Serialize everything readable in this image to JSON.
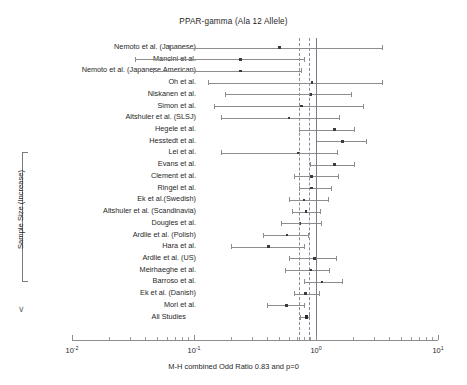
{
  "chart_data": {
    "type": "forest",
    "title": "PPAR-gamma (Ala 12 Allele)",
    "xlabel": "M-H combined Odd Ratio 0.83 and p=0",
    "ylabel": "Sample Size (Increase)",
    "xscale": "log10",
    "xlim": [
      0.01,
      10
    ],
    "grid": false,
    "legend": "none",
    "x_tick_labels": [
      "10",
      "10",
      "10",
      "10"
    ],
    "x_tick_exponents": [
      "-2",
      "-1",
      "0",
      "1"
    ],
    "x_tick_values": [
      0.01,
      0.1,
      1,
      10
    ],
    "reference_line_value": 1.0,
    "pooled_ci_lines": [
      0.73,
      0.87
    ],
    "pooled_odd_ratio": 0.83,
    "pooled_p_value": 0,
    "categories": [
      "Nemoto et al. (Japanese)",
      "Mancini et al.",
      "Nemoto et al. (Japanese American)",
      "Oh et al.",
      "Niskanen et al.",
      "Simon et al.",
      "Altshuler et al. (SLSJ)",
      "Hegele et al.",
      "Hesstedt et al.",
      "Lei et al.",
      "Evans et al.",
      "Clement et al.",
      "Ringel et al.",
      "Ek et al.(Swedish)",
      "Altshuler et al. (Scandinavia)",
      "Dougles et al.",
      "Ardlie et al. (Polish)",
      "Hara et al.",
      "Ardlie et al. (US)",
      "Meirhaeghe et al.",
      "Barroso et al.",
      "Ek et al. (Danish)",
      "Mori et al.",
      "All Studies"
    ],
    "studies": [
      {
        "label": "Nemoto et al. (Japanese)",
        "or": 0.5,
        "lo": 0.062,
        "hi": 3.5,
        "summary": false
      },
      {
        "label": "Mancini et al.",
        "or": 0.24,
        "lo": 0.033,
        "hi": 0.79,
        "summary": false
      },
      {
        "label": "Nemoto et al. (Japanese American)",
        "or": 0.24,
        "lo": 0.046,
        "hi": 0.76,
        "summary": false
      },
      {
        "label": "Oh et al.",
        "or": 0.93,
        "lo": 0.13,
        "hi": 3.5,
        "summary": false
      },
      {
        "label": "Niskanen et al.",
        "or": 0.9,
        "lo": 0.18,
        "hi": 1.95,
        "summary": false
      },
      {
        "label": "Simon et al.",
        "or": 0.76,
        "lo": 0.145,
        "hi": 2.45,
        "summary": false
      },
      {
        "label": "Altshuler et al. (SLSJ)",
        "or": 0.6,
        "lo": 0.165,
        "hi": 1.55,
        "summary": false
      },
      {
        "label": "Hegele et al.",
        "or": 1.42,
        "lo": 0.73,
        "hi": 2.05,
        "summary": false
      },
      {
        "label": "Hesstedt et al.",
        "or": 1.65,
        "lo": 1.0,
        "hi": 2.55,
        "summary": false
      },
      {
        "label": "Lei et al.",
        "or": 0.72,
        "lo": 0.167,
        "hi": 1.48,
        "summary": false
      },
      {
        "label": "Evans et al.",
        "or": 1.42,
        "lo": 0.9,
        "hi": 2.05,
        "summary": false
      },
      {
        "label": "Clement et al.",
        "or": 0.92,
        "lo": 0.66,
        "hi": 1.52,
        "summary": false
      },
      {
        "label": "Ringel et al.",
        "or": 0.92,
        "lo": 0.72,
        "hi": 1.32,
        "summary": false
      },
      {
        "label": "Ek et al.(Swedish)",
        "or": 0.8,
        "lo": 0.6,
        "hi": 1.25,
        "summary": false
      },
      {
        "label": "Altshuler et al. (Scandinavia)",
        "or": 0.83,
        "lo": 0.63,
        "hi": 1.07,
        "summary": false
      },
      {
        "label": "Dougles et al.",
        "or": 0.74,
        "lo": 0.52,
        "hi": 1.1,
        "summary": false
      },
      {
        "label": "Ardlie et al. (Polish)",
        "or": 0.58,
        "lo": 0.37,
        "hi": 0.86,
        "summary": false
      },
      {
        "label": "Hara et al.",
        "or": 0.41,
        "lo": 0.2,
        "hi": 0.8,
        "summary": false
      },
      {
        "label": "Ardlie et al. (US)",
        "or": 0.97,
        "lo": 0.6,
        "hi": 1.45,
        "summary": false
      },
      {
        "label": "Meirhaeghe et al.",
        "or": 0.9,
        "lo": 0.56,
        "hi": 1.28,
        "summary": false
      },
      {
        "label": "Barroso et al.",
        "or": 1.12,
        "lo": 0.8,
        "hi": 1.62,
        "summary": false
      },
      {
        "label": "Ek et al. (Danish)",
        "or": 0.82,
        "lo": 0.66,
        "hi": 1.05,
        "summary": false
      },
      {
        "label": "Mori et al.",
        "or": 0.57,
        "lo": 0.4,
        "hi": 0.8,
        "summary": false
      },
      {
        "label": "All Studies",
        "or": 0.83,
        "lo": 0.745,
        "hi": 0.88,
        "summary": true
      }
    ]
  }
}
